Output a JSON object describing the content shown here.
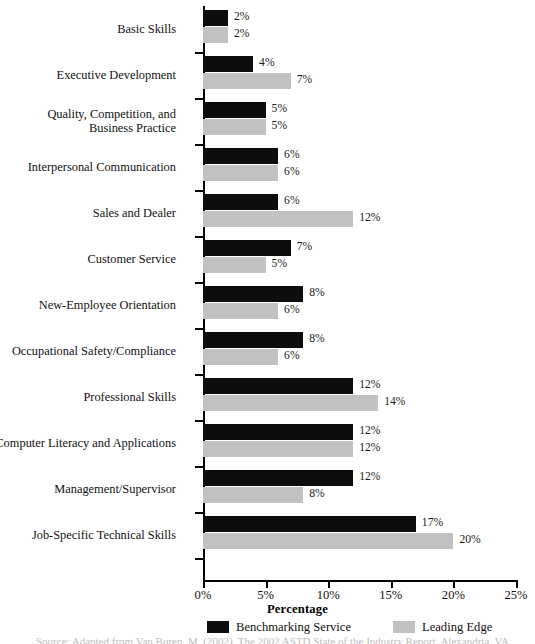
{
  "chart_data": {
    "type": "bar",
    "orientation": "horizontal",
    "title": "",
    "xlabel": "Percentage",
    "ylabel": "",
    "xlim": [
      0,
      25
    ],
    "xticks": [
      "0%",
      "5%",
      "10%",
      "15%",
      "20%",
      "25%"
    ],
    "xtick_values": [
      0,
      5,
      10,
      15,
      20,
      25
    ],
    "grid": false,
    "legend_position": "bottom",
    "categories": [
      "Basic Skills",
      "Executive Development",
      "Quality, Competition, and\nBusiness Practice",
      "Interpersonal Communication",
      "Sales and Dealer",
      "Customer Service",
      "New-Employee Orientation",
      "Occupational Safety/Compliance",
      "Professional Skills",
      "Computer Literacy and Applications",
      "Management/Supervisor",
      "Job-Specific Technical Skills"
    ],
    "series": [
      {
        "name": "Benchmarking Service",
        "color": "#0d0d0d",
        "values": [
          2,
          4,
          5,
          6,
          6,
          7,
          8,
          8,
          12,
          12,
          12,
          17
        ],
        "labels": [
          "2%",
          "4%",
          "5%",
          "6%",
          "6%",
          "7%",
          "8%",
          "8%",
          "12%",
          "12%",
          "12%",
          "17%"
        ]
      },
      {
        "name": "Leading Edge",
        "color": "#c2c2c2",
        "values": [
          2,
          7,
          5,
          6,
          12,
          5,
          6,
          6,
          14,
          12,
          8,
          20
        ],
        "labels": [
          "2%",
          "7%",
          "5%",
          "6%",
          "12%",
          "5%",
          "6%",
          "6%",
          "14%",
          "12%",
          "8%",
          "20%"
        ]
      }
    ]
  },
  "caption": {
    "text": "Source: Adapted from Van Buren, M. (2002). The 2002 ASTD State of the Industry Report. Alexandria, VA."
  }
}
